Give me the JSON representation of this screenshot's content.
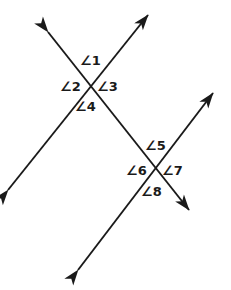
{
  "figure": {
    "background_color": "#ffffff",
    "line_color": "#1a1a1a",
    "label_color": "#1a1a1a",
    "width": 231,
    "height": 290
  },
  "lines": [
    {
      "id": "line-a",
      "name": "transversal-line-upper-left-to-upper-right",
      "from": {
        "x": 8,
        "y": 190
      },
      "to": {
        "x": 148,
        "y": 15
      },
      "arrowheads": "both"
    },
    {
      "id": "line-b",
      "name": "transversal-line-northwest-to-southeast",
      "from": {
        "x": 48,
        "y": 32
      },
      "to": {
        "x": 189,
        "y": 210
      },
      "arrowheads": "both"
    },
    {
      "id": "line-c",
      "name": "transversal-line-southwest-to-northeast",
      "from": {
        "x": 78,
        "y": 270
      },
      "to": {
        "x": 213,
        "y": 93
      },
      "arrowheads": "both"
    }
  ],
  "intersections": [
    {
      "id": "intersection-upper",
      "x": 92,
      "y": 87
    },
    {
      "id": "intersection-lower",
      "x": 157,
      "y": 172
    }
  ],
  "angle_labels": [
    {
      "id": "angle-1",
      "text": "∠1",
      "x": 80,
      "y": 54,
      "intersection": "intersection-upper",
      "position": "top"
    },
    {
      "id": "angle-2",
      "text": "∠2",
      "x": 60,
      "y": 80,
      "intersection": "intersection-upper",
      "position": "left"
    },
    {
      "id": "angle-3",
      "text": "∠3",
      "x": 97,
      "y": 80,
      "intersection": "intersection-upper",
      "position": "right"
    },
    {
      "id": "angle-4",
      "text": "∠4",
      "x": 75,
      "y": 100,
      "intersection": "intersection-upper",
      "position": "bottom"
    },
    {
      "id": "angle-5",
      "text": "∠5",
      "x": 145,
      "y": 139,
      "intersection": "intersection-lower",
      "position": "top"
    },
    {
      "id": "angle-6",
      "text": "∠6",
      "x": 126,
      "y": 164,
      "intersection": "intersection-lower",
      "position": "left"
    },
    {
      "id": "angle-7",
      "text": "∠7",
      "x": 162,
      "y": 164,
      "intersection": "intersection-lower",
      "position": "right"
    },
    {
      "id": "angle-8",
      "text": "∠8",
      "x": 141,
      "y": 185,
      "intersection": "intersection-lower",
      "position": "bottom"
    }
  ]
}
